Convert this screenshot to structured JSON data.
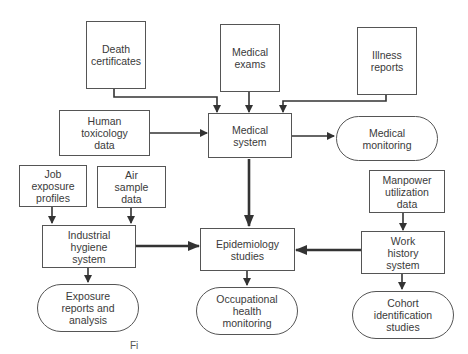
{
  "diagram": {
    "nodes": {
      "death_certificates": "Death\ncertificates",
      "medical_exams": "Medical\nexams",
      "illness_reports": "Illness\nreports",
      "human_toxicology": "Human\ntoxicology\ndata",
      "medical_system": "Medical\nsystem",
      "medical_monitoring": "Medical\nmonitoring",
      "job_exposure": "Job\nexposure\nprofiles",
      "air_sample": "Air\nsample\ndata",
      "manpower": "Manpower\nutilization\ndata",
      "industrial_hygiene": "Industrial\nhygiene\nsystem",
      "epidemiology": "Epidemiology\nstudies",
      "work_history": "Work\nhistory\nsystem",
      "exposure_reports": "Exposure\nreports and\nanalysis",
      "occupational_health": "Occupational\nhealth\nmonitoring",
      "cohort": "Cohort\nidentification\nstudies"
    },
    "edges": [
      {
        "from": "Death certificates",
        "to": "Medical system"
      },
      {
        "from": "Medical exams",
        "to": "Medical system"
      },
      {
        "from": "Illness reports",
        "to": "Medical system"
      },
      {
        "from": "Human toxicology data",
        "to": "Medical system"
      },
      {
        "from": "Medical system",
        "to": "Medical monitoring"
      },
      {
        "from": "Medical system",
        "to": "Epidemiology studies"
      },
      {
        "from": "Job exposure profiles",
        "to": "Industrial hygiene system"
      },
      {
        "from": "Air sample data",
        "to": "Industrial hygiene system"
      },
      {
        "from": "Industrial hygiene system",
        "to": "Epidemiology studies"
      },
      {
        "from": "Industrial hygiene system",
        "to": "Exposure reports and analysis"
      },
      {
        "from": "Manpower utilization data",
        "to": "Work history system"
      },
      {
        "from": "Work history system",
        "to": "Epidemiology studies"
      },
      {
        "from": "Work history system",
        "to": "Cohort identification studies"
      },
      {
        "from": "Epidemiology studies",
        "to": "Occupational health monitoring"
      }
    ],
    "caption": "Fi"
  }
}
